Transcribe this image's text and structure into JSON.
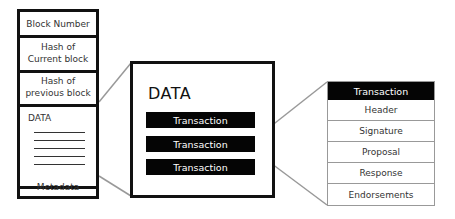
{
  "block": {
    "fields": [
      {
        "label": "Block Number"
      },
      {
        "label": "Hash of\nCurrent block"
      },
      {
        "label": "Hash of\nprevious block"
      },
      {
        "label": "DATA"
      },
      {
        "label": "Metadata"
      }
    ]
  },
  "data_box": {
    "title": "DATA",
    "transactions": [
      "Transaction",
      "Transaction",
      "Transaction"
    ]
  },
  "transaction_detail": {
    "title": "Transaction",
    "fields": [
      "Header",
      "Signature",
      "Proposal",
      "Response",
      "Endorsements"
    ]
  },
  "colors": {
    "border": "#111111",
    "bar_fill": "#050505",
    "connector": "#999999",
    "table_border": "#999999"
  }
}
